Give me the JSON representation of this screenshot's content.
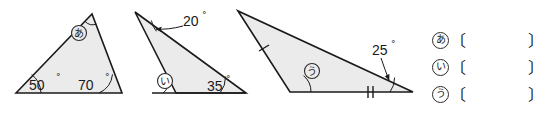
{
  "page": {
    "kind": "geometry-worksheet",
    "background": "#ffffff",
    "fill_color": "#ebebeb",
    "stroke_color": "#1a1a1a"
  },
  "figures": [
    {
      "id": "triangle-1",
      "labels": [
        {
          "name": "angle-label-50",
          "text": "50",
          "unit": "°"
        },
        {
          "name": "angle-label-70",
          "text": "70",
          "unit": "°"
        },
        {
          "name": "unknown-marker-a",
          "text": "あ"
        }
      ]
    },
    {
      "id": "triangle-2",
      "labels": [
        {
          "name": "angle-label-20",
          "text": "20",
          "unit": "°"
        },
        {
          "name": "angle-label-35",
          "text": "35",
          "unit": "°"
        },
        {
          "name": "unknown-marker-i",
          "text": "い"
        }
      ]
    },
    {
      "id": "triangle-3",
      "labels": [
        {
          "name": "angle-label-25",
          "text": "25",
          "unit": "°"
        },
        {
          "name": "unknown-marker-u",
          "text": "う"
        }
      ],
      "tick_marks": [
        {
          "name": "tick-single-left-side",
          "count": 1
        },
        {
          "name": "tick-double-bottom-side",
          "count": 2
        }
      ]
    }
  ],
  "answers": {
    "rows": [
      {
        "label": "あ",
        "bracket_open": "〔",
        "bracket_close": "〕",
        "value": ""
      },
      {
        "label": "い",
        "bracket_open": "〔",
        "bracket_close": "〕",
        "value": ""
      },
      {
        "label": "う",
        "bracket_open": "〔",
        "bracket_close": "〕",
        "value": ""
      }
    ]
  }
}
